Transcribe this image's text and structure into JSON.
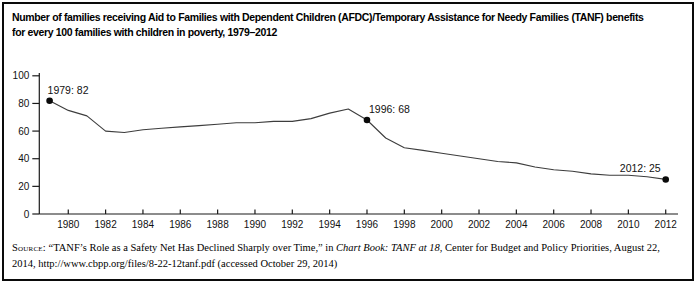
{
  "title": {
    "line1": "Number of families receiving Aid to Families with Dependent Children (AFDC)/Temporary Assistance for Needy Families (TANF) benefits",
    "line2": "for every 100 families with children in poverty, 1979–2012"
  },
  "chart_data": {
    "type": "line",
    "series_name": "Families receiving AFDC/TANF per 100 families with children in poverty",
    "x": [
      1979,
      1980,
      1981,
      1982,
      1983,
      1984,
      1985,
      1986,
      1987,
      1988,
      1989,
      1990,
      1991,
      1992,
      1993,
      1994,
      1995,
      1996,
      1997,
      1998,
      1999,
      2000,
      2001,
      2002,
      2003,
      2004,
      2005,
      2006,
      2007,
      2008,
      2009,
      2010,
      2011,
      2012
    ],
    "values": [
      82,
      75,
      71,
      60,
      59,
      61,
      62,
      63,
      64,
      65,
      66,
      66,
      67,
      67,
      69,
      73,
      76,
      68,
      55,
      48,
      46,
      44,
      42,
      40,
      38,
      37,
      34,
      32,
      31,
      29,
      28,
      28,
      27,
      25
    ],
    "ylim": [
      0,
      100
    ],
    "yticks": [
      0,
      20,
      40,
      60,
      80,
      100
    ],
    "xticks": [
      1980,
      1982,
      1984,
      1986,
      1988,
      1990,
      1992,
      1994,
      1996,
      1998,
      2000,
      2002,
      2004,
      2006,
      2008,
      2010,
      2012
    ],
    "grid": false,
    "legend": "none",
    "xlabel": "",
    "ylabel": "",
    "line_color": "#3d3d3d",
    "point_color": "#0a0a0a",
    "axis_color": "#1a1a1a",
    "annotations": [
      {
        "year": 1979,
        "value": 82,
        "label": "1979: 82",
        "anchor": "start",
        "dx": -2,
        "dy": -7
      },
      {
        "year": 1996,
        "value": 68,
        "label": "1996: 68",
        "anchor": "start",
        "dx": 2,
        "dy": -7
      },
      {
        "year": 2012,
        "value": 25,
        "label": "2012: 25",
        "anchor": "end",
        "dx": -5,
        "dy": -7
      }
    ]
  },
  "source": {
    "label": "Source:",
    "pre": " “TANF’s Role as a Safety Net Has Declined Sharply over Time,” in ",
    "italic": "Chart Book: TANF at 18",
    "post": ", Center for Budget and Policy Priorities, August 22, 2014, http://www.cbpp.org/files/8-22-12tanf.pdf (accessed October 29, 2014)"
  }
}
